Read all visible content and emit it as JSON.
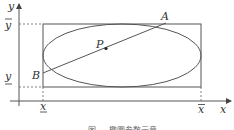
{
  "figure": {
    "axes": {
      "x_label": "x",
      "y_label": "y"
    },
    "bounds": {
      "x_min_label": "x",
      "x_max_label": "x",
      "y_min_label": "y",
      "y_max_label": "y",
      "x_min_decoration": "underline",
      "x_max_decoration": "overline",
      "y_min_decoration": "underline",
      "y_max_decoration": "overline"
    },
    "points": {
      "A": "A",
      "B": "B",
      "P": "P"
    },
    "shapes": [
      "bounding-rectangle",
      "inscribed-ellipse",
      "segment-AB"
    ],
    "caption": "图 ... 椭圆参数示意"
  },
  "colors": {
    "stroke": "#555555",
    "dash": "#666666",
    "text": "#333333",
    "background": "#ffffff"
  }
}
